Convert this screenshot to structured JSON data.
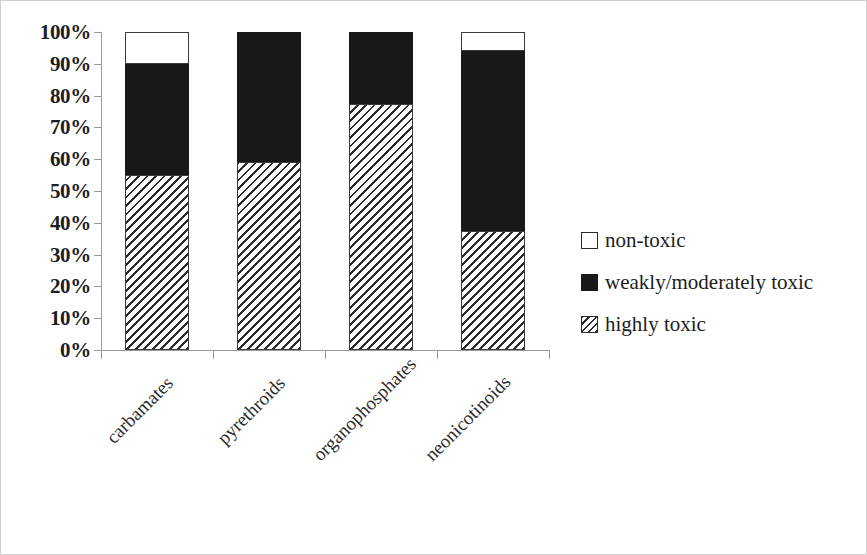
{
  "chart_data": {
    "type": "bar",
    "subtype": "stacked-100-percent",
    "title": "",
    "subtitle": "",
    "xlabel": "",
    "ylabel": "",
    "ylim": [
      0,
      100
    ],
    "yticks": [
      "0%",
      "10%",
      "20%",
      "30%",
      "40%",
      "50%",
      "60%",
      "70%",
      "80%",
      "90%",
      "100%"
    ],
    "ytick_values": [
      0,
      10,
      20,
      30,
      40,
      50,
      60,
      70,
      80,
      90,
      100
    ],
    "grid": false,
    "legend_position": "right",
    "categories": [
      "carbamates",
      "pyrethroids",
      "organophosphates",
      "neonicotinoids"
    ],
    "series": [
      {
        "name": "highly toxic",
        "fill": "diagonal-hatch",
        "values": [
          55,
          59,
          77.5,
          37.5
        ]
      },
      {
        "name": "weakly/moderately toxic",
        "fill": "solid-black",
        "values": [
          35,
          41,
          22.5,
          56.5
        ]
      },
      {
        "name": "non-toxic",
        "fill": "white",
        "values": [
          10,
          0,
          0,
          6
        ]
      }
    ]
  },
  "axis": {
    "y_ticks": [
      {
        "label": "100%",
        "value": 100
      },
      {
        "label": "90%",
        "value": 90
      },
      {
        "label": "80%",
        "value": 80
      },
      {
        "label": "70%",
        "value": 70
      },
      {
        "label": "60%",
        "value": 60
      },
      {
        "label": "50%",
        "value": 50
      },
      {
        "label": "40%",
        "value": 40
      },
      {
        "label": "30%",
        "value": 30
      },
      {
        "label": "20%",
        "value": 20
      },
      {
        "label": "10%",
        "value": 10
      },
      {
        "label": "0%",
        "value": 0
      }
    ],
    "categories": [
      {
        "label": "carbamates"
      },
      {
        "label": "pyrethroids"
      },
      {
        "label": "organophosphates"
      },
      {
        "label": "neonicotinoids"
      }
    ]
  },
  "legend": {
    "items": [
      {
        "label": "non-toxic",
        "swatch": "white-square-icon",
        "style": "nontoxic"
      },
      {
        "label": "weakly/moderately toxic",
        "swatch": "black-square-icon",
        "style": "weak"
      },
      {
        "label": "highly toxic",
        "swatch": "hatched-square-icon",
        "style": "highly"
      }
    ]
  },
  "colors": {
    "weakly_moderately_toxic": "#181818",
    "highly_toxic_hatch": "#2b2b2b",
    "non_toxic": "#ffffff",
    "axis": "#9a9a9a",
    "border": "#cfcfcf",
    "text": "#1d1d1d"
  }
}
